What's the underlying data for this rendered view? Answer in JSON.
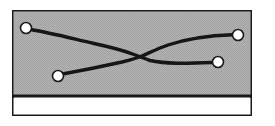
{
  "figure": {
    "kind": "scanned-grayscale-network-diagram",
    "caption": "",
    "canvas": {
      "width": 275,
      "height": 126,
      "background": "#ffffff"
    },
    "frame": {
      "name": "outer-frame",
      "x": 12,
      "y": 10,
      "width": 240,
      "height": 106,
      "stroke_color": "#1a1a1a",
      "stroke_width": 2,
      "fill": "#ffffff"
    },
    "panels": [
      {
        "name": "upper-gray-panel",
        "x": 13,
        "y": 11,
        "width": 238,
        "height": 84,
        "fill_color": "#b4b4b4",
        "texture": "halftone-dither"
      },
      {
        "name": "lower-white-panel",
        "x": 13,
        "y": 98,
        "width": 238,
        "height": 17,
        "fill_color": "#ffffff",
        "texture": "none"
      }
    ],
    "divider": {
      "name": "panel-divider",
      "x1": 13,
      "y1": 96,
      "x2": 251,
      "y2": 96,
      "stroke_color": "#1a1a1a",
      "stroke_width": 3
    },
    "nodes": [
      {
        "id": "n1",
        "label": "",
        "cx": 26,
        "cy": 28,
        "r": 5.5,
        "fill_color": "#ffffff",
        "stroke_color": "#1a1a1a",
        "stroke_width": 1.6
      },
      {
        "id": "n2",
        "label": "",
        "cx": 58,
        "cy": 76,
        "r": 5.5,
        "fill_color": "#ffffff",
        "stroke_color": "#1a1a1a",
        "stroke_width": 1.6
      },
      {
        "id": "n3",
        "label": "",
        "cx": 238,
        "cy": 35,
        "r": 5.5,
        "fill_color": "#ffffff",
        "stroke_color": "#1a1a1a",
        "stroke_width": 1.6
      },
      {
        "id": "n4",
        "label": "",
        "cx": 218,
        "cy": 62,
        "r": 5.5,
        "fill_color": "#ffffff",
        "stroke_color": "#1a1a1a",
        "stroke_width": 1.6
      }
    ],
    "junction": {
      "name": "crossing-point",
      "x": 141,
      "y": 57
    },
    "edges": [
      {
        "id": "e1",
        "from": "n1",
        "to": "n4",
        "stroke_color": "#141414",
        "stroke_width": 3.4,
        "path": "M 30.5 29.5 C 52 33 74 39 94 43.5 C 108 46.5 122 50 134 54.5 C 140 56.5 145 59 150 60.5 C 166 64 185 63.5 212.5 62.5"
      },
      {
        "id": "e2",
        "from": "n2",
        "to": "n3",
        "stroke_color": "#141414",
        "stroke_width": 3.4,
        "path": "M 62.5 74 C 82 70.5 104 66 122 62 C 130 60 136 58.5 142 56 C 150 52.5 158 48.5 168 45 C 188 38.5 212 35.5 232.5 34.8"
      }
    ]
  }
}
